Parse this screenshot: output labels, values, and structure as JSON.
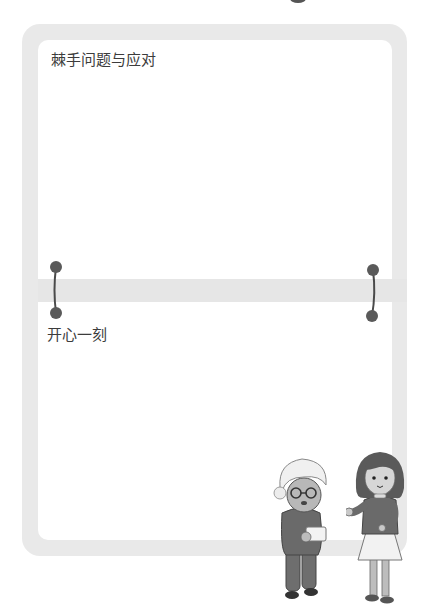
{
  "sections": [
    {
      "title": "棘手问题与应对"
    },
    {
      "title": "开心一刻"
    }
  ],
  "colors": {
    "frame": "#e9e9e9",
    "panel": "#ffffff",
    "pin": "#5a5a5a",
    "text": "#3c3c3c"
  },
  "illustration": {
    "characters": [
      "grandmother-holding-envelope",
      "girl-waving"
    ]
  }
}
